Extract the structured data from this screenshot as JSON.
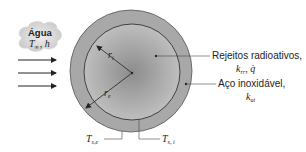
{
  "figure": {
    "fluid": {
      "name": "Água",
      "temperature_symbol": "T",
      "temperature_subscript": "∞",
      "coefficient_symbol": "h"
    },
    "flow_arrows": {
      "count": 3,
      "direction": "right"
    },
    "labels": {
      "waste": {
        "line1": "Rejeitos radioativos,",
        "k_symbol": "k",
        "k_subscript": "rr",
        "sep": ", ",
        "q_symbol": "q̇"
      },
      "steel": {
        "line1": "Aço inoxidável,",
        "k_symbol": "k",
        "k_subscript": "ai"
      },
      "r_inner": {
        "symbol": "r",
        "subscript": "i"
      },
      "r_outer": {
        "symbol": "r",
        "subscript": "e"
      },
      "T_outer_surface": {
        "symbol": "T",
        "subscript": "s,e"
      },
      "T_inner_surface": {
        "symbol": "T",
        "subscript": "s, i"
      }
    },
    "colors": {
      "outer_shell": "#a6a6a6",
      "core_center": "#8e8e8e",
      "core_edge": "#bdbdbd",
      "lines": "#333333",
      "cloud": "#d4d4d4"
    }
  }
}
